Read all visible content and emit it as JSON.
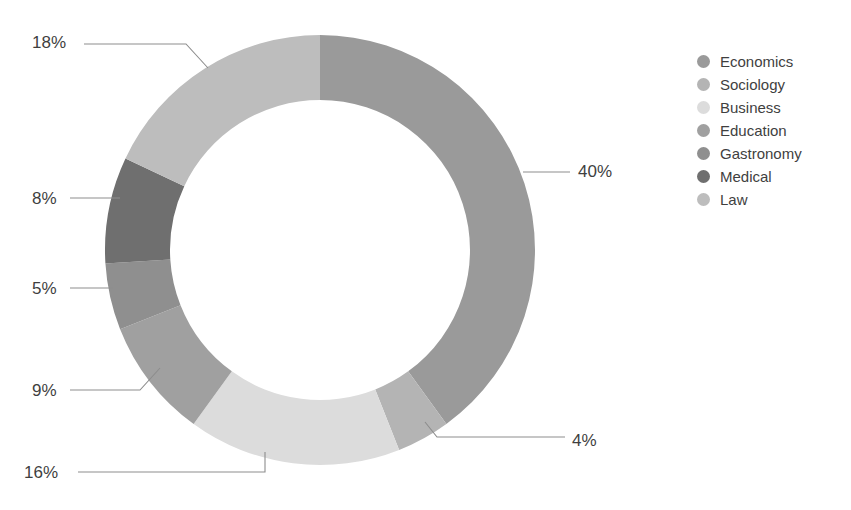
{
  "chart_data": {
    "type": "pie",
    "variant": "donut",
    "title": "",
    "subtitle": "",
    "xlabel": "",
    "ylabel": "",
    "grid": false,
    "legend_position": "right",
    "value_suffix": "%",
    "total": 100,
    "start_angle_deg": 0,
    "direction": "clockwise",
    "categories": [
      "Economics",
      "Sociology",
      "Business",
      "Education",
      "Gastronomy",
      "Medical",
      "Law"
    ],
    "values": [
      40,
      4,
      16,
      9,
      5,
      8,
      18
    ],
    "labels": [
      "40%",
      "4%",
      "16%",
      "9%",
      "5%",
      "8%",
      "18%"
    ],
    "colors": [
      "#9a9a9a",
      "#b4b4b4",
      "#dcdcdc",
      "#a0a0a0",
      "#8f8f8f",
      "#6f6f6f",
      "#bdbdbd"
    ],
    "slices": [
      {
        "name": "Economics",
        "value": 40,
        "label": "40%",
        "color": "#9a9a9a"
      },
      {
        "name": "Sociology",
        "value": 4,
        "label": "4%",
        "color": "#b4b4b4"
      },
      {
        "name": "Business",
        "value": 16,
        "label": "16%",
        "color": "#dcdcdc"
      },
      {
        "name": "Education",
        "value": 9,
        "label": "9%",
        "color": "#a0a0a0"
      },
      {
        "name": "Gastronomy",
        "value": 5,
        "label": "5%",
        "color": "#8f8f8f"
      },
      {
        "name": "Medical",
        "value": 8,
        "label": "8%",
        "color": "#6f6f6f"
      },
      {
        "name": "Law",
        "value": 18,
        "label": "18%",
        "color": "#bdbdbd"
      }
    ]
  },
  "legend": {
    "items": [
      {
        "label": "Economics",
        "color": "#9a9a9a"
      },
      {
        "label": "Sociology",
        "color": "#b4b4b4"
      },
      {
        "label": "Business",
        "color": "#dcdcdc"
      },
      {
        "label": "Education",
        "color": "#a0a0a0"
      },
      {
        "label": "Gastronomy",
        "color": "#8f8f8f"
      },
      {
        "label": "Medical",
        "color": "#6f6f6f"
      },
      {
        "label": "Law",
        "color": "#bdbdbd"
      }
    ]
  },
  "callouts": [
    {
      "name": "law",
      "text": "18%",
      "x": 32,
      "y": 48,
      "anchor": "start"
    },
    {
      "name": "medical",
      "text": "8%",
      "x": 32,
      "y": 204,
      "anchor": "start"
    },
    {
      "name": "gastronomy",
      "text": "5%",
      "x": 32,
      "y": 294,
      "anchor": "start"
    },
    {
      "name": "education",
      "text": "9%",
      "x": 32,
      "y": 396,
      "anchor": "start"
    },
    {
      "name": "business",
      "text": "16%",
      "x": 24,
      "y": 478,
      "anchor": "start"
    },
    {
      "name": "economics",
      "text": "40%",
      "x": 578,
      "y": 177,
      "anchor": "start"
    },
    {
      "name": "sociology",
      "text": "4%",
      "x": 572,
      "y": 446,
      "anchor": "start"
    }
  ],
  "style": {
    "background": "#ffffff",
    "text_color": "#3f3f3f",
    "leader_color": "#8d8d8d"
  }
}
